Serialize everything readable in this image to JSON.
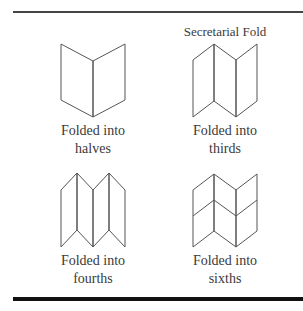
{
  "figure": {
    "heading": "Secretarial Fold",
    "panels": [
      {
        "id": "halves",
        "label_line1": "Folded into",
        "label_line2": "halves"
      },
      {
        "id": "thirds",
        "label_line1": "Folded into",
        "label_line2": "thirds"
      },
      {
        "id": "fourths",
        "label_line1": "Folded into",
        "label_line2": "fourths"
      },
      {
        "id": "sixths",
        "label_line1": "Folded into",
        "label_line2": "sixths"
      }
    ],
    "colors": {
      "line": "#555555",
      "text": "#3a3a3a",
      "top_rule": "#444444",
      "bottom_rule": "#111111"
    }
  }
}
